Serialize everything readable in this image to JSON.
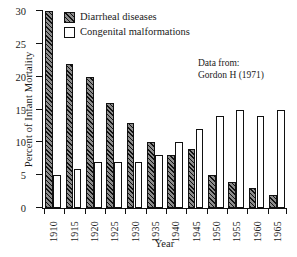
{
  "chart_data": {
    "type": "bar",
    "title": "",
    "xlabel": "Year",
    "ylabel": "Percent of Infant Mortality",
    "categories": [
      "1910",
      "1915",
      "1920",
      "1925",
      "1930",
      "1935",
      "1940",
      "1945",
      "1950",
      "1955",
      "1960",
      "1965"
    ],
    "series": [
      {
        "name": "Diarrheal diseases",
        "style": "hatched",
        "values": [
          30,
          22,
          20,
          16,
          13,
          10,
          8,
          9,
          5,
          4,
          3,
          2
        ]
      },
      {
        "name": "Congenital malformations",
        "style": "open",
        "values": [
          5,
          6,
          7,
          7,
          7,
          8,
          10,
          12,
          14,
          15,
          14,
          15
        ]
      }
    ],
    "ylim": [
      0,
      30
    ],
    "yticks": [
      0,
      5,
      10,
      15,
      20,
      25,
      30
    ],
    "ytick_labels": [
      "0",
      "5",
      "10",
      "15",
      "20",
      "25",
      "30"
    ],
    "grid": false,
    "legend_position": "top-left",
    "annotations": [
      {
        "line1": "Data from:",
        "line2": "Gordon H (1971)"
      }
    ]
  }
}
